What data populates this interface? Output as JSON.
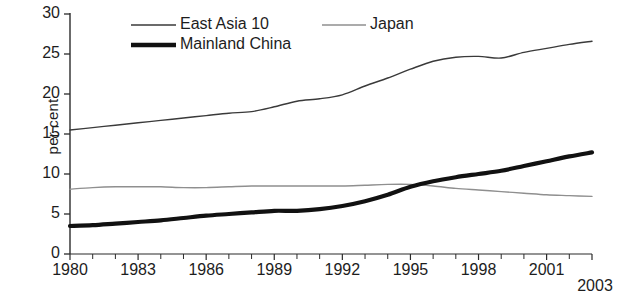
{
  "chart_data": {
    "type": "line",
    "title": "",
    "subtitle": "",
    "xlabel": "",
    "ylabel": "per cent",
    "xlim": [
      1980,
      2003
    ],
    "ylim": [
      0,
      30
    ],
    "grid": false,
    "legend_position": "top-center",
    "y_ticks": [
      30,
      25,
      20,
      15,
      10,
      5,
      0
    ],
    "x_ticks": [
      1980,
      1983,
      1986,
      1989,
      1992,
      1995,
      1998,
      2001,
      2003
    ],
    "x_tick_labels": [
      "1980",
      "1983",
      "1986",
      "1989",
      "1992",
      "1995",
      "1998",
      "2001",
      "2003"
    ],
    "x_minor_ticks_every": 1,
    "x": [
      1980,
      1981,
      1982,
      1983,
      1984,
      1985,
      1986,
      1987,
      1988,
      1989,
      1990,
      1991,
      1992,
      1993,
      1994,
      1995,
      1996,
      1997,
      1998,
      1999,
      2000,
      2001,
      2002,
      2003
    ],
    "series": [
      {
        "name": "East Asia 10",
        "color": "#3a3a3a",
        "width": 1.4,
        "values": [
          15.5,
          15.8,
          16.1,
          16.4,
          16.7,
          17.0,
          17.3,
          17.6,
          17.8,
          18.4,
          19.1,
          19.4,
          19.9,
          21.0,
          22.0,
          23.1,
          24.1,
          24.6,
          24.7,
          24.5,
          25.2,
          25.7,
          26.2,
          26.6
        ]
      },
      {
        "name": "Japan",
        "color": "#8f8f8f",
        "width": 1.4,
        "values": [
          8.1,
          8.3,
          8.4,
          8.4,
          8.4,
          8.3,
          8.3,
          8.4,
          8.5,
          8.5,
          8.5,
          8.5,
          8.5,
          8.6,
          8.7,
          8.7,
          8.5,
          8.2,
          8.0,
          7.8,
          7.6,
          7.4,
          7.3,
          7.2
        ]
      },
      {
        "name": "Mainland China",
        "color": "#111111",
        "width": 4.2,
        "values": [
          3.5,
          3.6,
          3.8,
          4.0,
          4.2,
          4.5,
          4.8,
          5.0,
          5.2,
          5.4,
          5.4,
          5.6,
          6.0,
          6.6,
          7.4,
          8.4,
          9.1,
          9.6,
          10.0,
          10.4,
          11.0,
          11.6,
          12.2,
          12.7
        ]
      }
    ],
    "legend": [
      {
        "label": "East Asia 10",
        "color": "#3a3a3a",
        "width": 1.6
      },
      {
        "label": "Japan",
        "color": "#8f8f8f",
        "width": 1.6
      },
      {
        "label": "Mainland China",
        "color": "#111111",
        "width": 4.5
      }
    ]
  },
  "axis": {
    "y_label": "per cent",
    "y_tick_labels": [
      "30",
      "25",
      "20",
      "15",
      "10",
      "5",
      "0"
    ]
  }
}
